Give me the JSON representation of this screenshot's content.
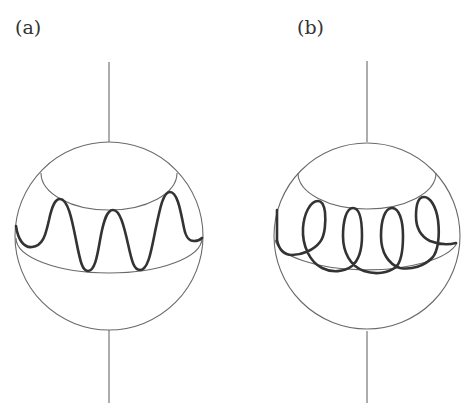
{
  "figure": {
    "panels": [
      {
        "id": "a",
        "label": "(a)",
        "description": "Sphere with vertical axis; a sinusoidal (wavy) thick curve oscillating between an upper latitude circle and the equator",
        "curve_type": "wave"
      },
      {
        "id": "b",
        "label": "(b)",
        "description": "Sphere with vertical axis; a looped (trochoidal/cycloidal) thick curve with loops between an upper latitude circle and the equator",
        "curve_type": "loops"
      }
    ],
    "colors": {
      "background": "#ffffff",
      "thin_line": "#6a6a6a",
      "thick_curve": "#333333",
      "label_text": "#333333"
    }
  }
}
